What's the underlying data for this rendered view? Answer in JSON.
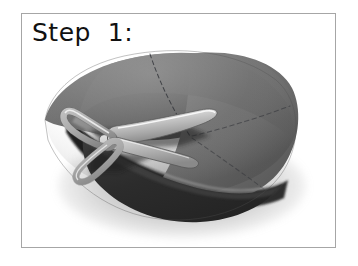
{
  "caption": {
    "text": "Step  1:",
    "label": "Step 1:",
    "color": "#111111"
  },
  "frame": {
    "border_color": "#a6a6a6",
    "background": "#ffffff",
    "left": 21,
    "top": 13,
    "width": 315,
    "height": 235
  },
  "photo": {
    "description": "A gray paper circle folded into a shallow cone, being cut with a pair of scissors. Faint dashed guide lines radiate from the center of the circle.",
    "subject": "paper-circle-and-scissors",
    "background": "#ffffff"
  },
  "colors": {
    "paper_light": "#7c7c7c",
    "paper_mid": "#6e6e6e",
    "paper_dark": "#5a5a5a",
    "paper_flap_dark": "#2b2b2b",
    "under_shadow": "#1a1a1a",
    "table_shadow": "#9a9a9a",
    "scissor_metal_light": "#e9e9e9",
    "scissor_metal_mid": "#c2c2c2",
    "scissor_metal_dark": "#8d8d8d",
    "scissor_outline": "#4a4a4a",
    "dashed_guide": "#3a3a3a",
    "frame_border": "#a6a6a6",
    "page_background": "#ffffff"
  },
  "objects": [
    {
      "name": "paper-circle",
      "material": "construction paper",
      "tone": "gray"
    },
    {
      "name": "cone-fold-flap",
      "tone": "dark gray"
    },
    {
      "name": "scissors",
      "material": "metal blades with light handles"
    },
    {
      "name": "dashed-guide-lines",
      "count": 3,
      "style": "dashed"
    },
    {
      "name": "drop-shadow",
      "tone": "soft gray"
    }
  ]
}
